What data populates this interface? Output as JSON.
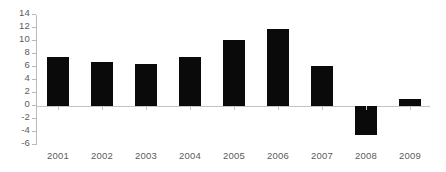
{
  "chart_data": {
    "type": "bar",
    "title": "",
    "subtitle": "",
    "xlabel": "",
    "ylabel": "",
    "categories": [
      "2001",
      "2002",
      "2003",
      "2004",
      "2005",
      "2006",
      "2007",
      "2008",
      "2009"
    ],
    "values": [
      7.6,
      6.8,
      6.5,
      7.5,
      10.1,
      11.8,
      6.2,
      -4.5,
      1.1
    ],
    "ylim": [
      -6,
      14
    ],
    "ytick_step": 2,
    "yticks": [
      "14",
      "12",
      "10",
      "8",
      "6",
      "4",
      "2",
      "0",
      "-2",
      "-4",
      "-6"
    ],
    "ytick_values": [
      14,
      12,
      10,
      8,
      6,
      4,
      2,
      0,
      -2,
      -4,
      -6
    ],
    "grid": false,
    "legend": "none",
    "series": [
      {
        "name": "",
        "values": [
          7.6,
          6.8,
          6.5,
          7.5,
          10.1,
          11.8,
          6.2,
          -4.5,
          1.1
        ]
      }
    ],
    "colors": {
      "bar": "#0a0a0a",
      "axis": "#b9b9b9",
      "zero_line": "#c4c4c4",
      "tick_label": "#5b5b5b",
      "background": "#ffffff"
    }
  }
}
